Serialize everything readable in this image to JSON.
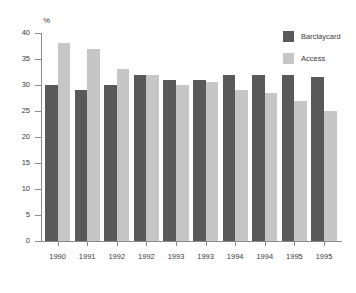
{
  "chart_data": {
    "type": "bar",
    "title": "",
    "subtitle": "",
    "xlabel": "",
    "ylabel": "%",
    "ylim": [
      0,
      40
    ],
    "yticks": [
      0,
      5,
      10,
      15,
      20,
      25,
      30,
      35,
      40
    ],
    "grid": false,
    "legend_position": "top-right",
    "categories": [
      "1990",
      "1991",
      "1992",
      "1992",
      "1993",
      "1993",
      "1994",
      "1994",
      "1995",
      "1995"
    ],
    "series": [
      {
        "name": "Barclaycard",
        "color": "#595959",
        "values": [
          30,
          29,
          30,
          32,
          31,
          31,
          32,
          32,
          32,
          31.5
        ]
      },
      {
        "name": "Access",
        "color": "#c6c6c6",
        "values": [
          38,
          37,
          33,
          32,
          30,
          30.5,
          29,
          28.5,
          27,
          25
        ]
      }
    ]
  },
  "legend": {
    "entries": [
      {
        "label": "Barclaycard",
        "color": "#595959"
      },
      {
        "label": "Access",
        "color": "#c6c6c6"
      }
    ]
  },
  "axes": {
    "y_unit_label": "%",
    "y_tick_labels": [
      "0",
      "5",
      "10",
      "15",
      "20",
      "25",
      "30",
      "35",
      "40"
    ],
    "x_tick_labels": [
      "1990",
      "1991",
      "1992",
      "1992",
      "1993",
      "1993",
      "1994",
      "1994",
      "1995",
      "1995"
    ]
  },
  "colors": {
    "background": "#ffffff",
    "axis": "#8a8a8a",
    "text": "#3a3a3a",
    "series_dark": "#595959",
    "series_light": "#c6c6c6"
  }
}
